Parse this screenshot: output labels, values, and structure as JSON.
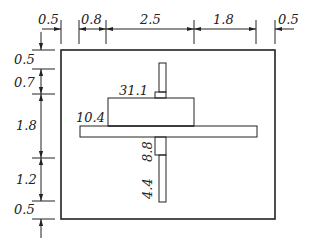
{
  "diagram": {
    "type": "stress-distribution-on-base-slab",
    "top_dimensions": [
      {
        "id": "left-margin",
        "value": "0.5"
      },
      {
        "id": "left-step",
        "value": "0.8"
      },
      {
        "id": "central-block",
        "value": "2.5"
      },
      {
        "id": "right-step",
        "value": "1.8"
      },
      {
        "id": "right-margin",
        "value": "0.5"
      }
    ],
    "left_dimensions": [
      {
        "id": "top-margin",
        "value": "0.5"
      },
      {
        "id": "upper-band",
        "value": "0.7"
      },
      {
        "id": "middle-band",
        "value": "1.8"
      },
      {
        "id": "lower-band",
        "value": "1.2"
      },
      {
        "id": "bottom-margin",
        "value": "0.5"
      }
    ],
    "value_labels": {
      "low_step": "10.4",
      "high_block": "31.1",
      "vertical_upper": "8.8",
      "vertical_lower": "4.4"
    },
    "colors": {
      "line": "#222222",
      "background": "#ffffff"
    }
  }
}
